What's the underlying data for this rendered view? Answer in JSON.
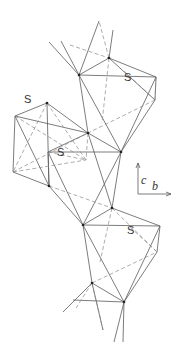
{
  "figure": {
    "type": "crystal-structure-polyhedra",
    "labels": [
      {
        "text": "S",
        "x": 127,
        "y": 78
      },
      {
        "text": "S",
        "x": 27,
        "y": 100
      },
      {
        "text": "S",
        "x": 60,
        "y": 153
      },
      {
        "text": "S",
        "x": 130,
        "y": 231
      }
    ],
    "axes": {
      "c_label": "c",
      "b_label": "b",
      "origin": [
        138,
        194
      ],
      "c_tip": [
        138,
        163
      ],
      "b_tip": [
        171,
        194
      ]
    },
    "colors": {
      "solid": "#5a5a5a",
      "dashed": "#8a8a8a",
      "node": "#222222"
    },
    "nodes": [
      [
        79,
        75
      ],
      [
        109,
        58
      ],
      [
        88,
        133
      ],
      [
        121,
        152
      ],
      [
        47,
        103
      ],
      [
        49,
        186
      ],
      [
        112,
        208
      ],
      [
        83,
        225
      ],
      [
        92,
        283
      ],
      [
        124,
        302
      ]
    ],
    "solid_lines": [
      [
        [
          49,
          42
        ],
        [
          79,
          75
        ]
      ],
      [
        [
          61,
          41
        ],
        [
          79,
          75
        ]
      ],
      [
        [
          79,
          75
        ],
        [
          99,
          21
        ]
      ],
      [
        [
          109,
          58
        ],
        [
          113,
          30
        ]
      ],
      [
        [
          79,
          75
        ],
        [
          109,
          58
        ]
      ],
      [
        [
          79,
          75
        ],
        [
          156,
          77
        ]
      ],
      [
        [
          109,
          58
        ],
        [
          156,
          77
        ]
      ],
      [
        [
          156,
          77
        ],
        [
          155,
          100
        ]
      ],
      [
        [
          155,
          100
        ],
        [
          121,
          152
        ]
      ],
      [
        [
          156,
          77
        ],
        [
          121,
          152
        ]
      ],
      [
        [
          79,
          75
        ],
        [
          88,
          133
        ]
      ],
      [
        [
          79,
          75
        ],
        [
          121,
          152
        ]
      ],
      [
        [
          109,
          58
        ],
        [
          155,
          100
        ]
      ],
      [
        [
          47,
          103
        ],
        [
          15,
          116
        ]
      ],
      [
        [
          47,
          103
        ],
        [
          88,
          133
        ]
      ],
      [
        [
          15,
          116
        ],
        [
          88,
          133
        ]
      ],
      [
        [
          15,
          116
        ],
        [
          13,
          172
        ]
      ],
      [
        [
          15,
          116
        ],
        [
          49,
          186
        ]
      ],
      [
        [
          47,
          103
        ],
        [
          49,
          186
        ]
      ],
      [
        [
          13,
          172
        ],
        [
          49,
          186
        ]
      ],
      [
        [
          88,
          133
        ],
        [
          121,
          152
        ]
      ],
      [
        [
          48,
          152
        ],
        [
          121,
          152
        ]
      ],
      [
        [
          48,
          152
        ],
        [
          88,
          133
        ]
      ],
      [
        [
          48,
          152
        ],
        [
          49,
          186
        ]
      ],
      [
        [
          48,
          152
        ],
        [
          83,
          225
        ]
      ],
      [
        [
          49,
          186
        ],
        [
          83,
          225
        ]
      ],
      [
        [
          121,
          152
        ],
        [
          112,
          208
        ]
      ],
      [
        [
          121,
          152
        ],
        [
          83,
          225
        ]
      ],
      [
        [
          88,
          133
        ],
        [
          112,
          208
        ]
      ],
      [
        [
          83,
          225
        ],
        [
          112,
          208
        ]
      ],
      [
        [
          112,
          208
        ],
        [
          160,
          226
        ]
      ],
      [
        [
          83,
          225
        ],
        [
          160,
          226
        ]
      ],
      [
        [
          160,
          226
        ],
        [
          157,
          252
        ]
      ],
      [
        [
          157,
          252
        ],
        [
          124,
          302
        ]
      ],
      [
        [
          160,
          226
        ],
        [
          124,
          302
        ]
      ],
      [
        [
          83,
          225
        ],
        [
          92,
          283
        ]
      ],
      [
        [
          83,
          225
        ],
        [
          124,
          302
        ]
      ],
      [
        [
          92,
          283
        ],
        [
          124,
          302
        ]
      ],
      [
        [
          73,
          300
        ],
        [
          124,
          302
        ]
      ],
      [
        [
          63,
          312
        ],
        [
          92,
          283
        ]
      ],
      [
        [
          92,
          283
        ],
        [
          103,
          330
        ]
      ],
      [
        [
          124,
          302
        ],
        [
          114,
          342
        ]
      ],
      [
        [
          124,
          302
        ],
        [
          123,
          342
        ]
      ]
    ],
    "dashed_lines": [
      [
        [
          70,
          45
        ],
        [
          109,
          58
        ]
      ],
      [
        [
          109,
          58
        ],
        [
          99,
          21
        ]
      ],
      [
        [
          109,
          58
        ],
        [
          102,
          123
        ]
      ],
      [
        [
          156,
          77
        ],
        [
          155,
          100
        ]
      ],
      [
        [
          124,
          71
        ],
        [
          155,
          100
        ]
      ],
      [
        [
          155,
          100
        ],
        [
          88,
          133
        ]
      ],
      [
        [
          47,
          103
        ],
        [
          86,
          160
        ]
      ],
      [
        [
          15,
          116
        ],
        [
          86,
          160
        ]
      ],
      [
        [
          13,
          172
        ],
        [
          86,
          160
        ]
      ],
      [
        [
          88,
          133
        ],
        [
          86,
          160
        ]
      ],
      [
        [
          48,
          152
        ],
        [
          86,
          160
        ]
      ],
      [
        [
          13,
          172
        ],
        [
          88,
          133
        ]
      ],
      [
        [
          49,
          186
        ],
        [
          112,
          208
        ]
      ],
      [
        [
          47,
          103
        ],
        [
          13,
          172
        ]
      ],
      [
        [
          112,
          208
        ],
        [
          100,
          262
        ]
      ],
      [
        [
          130,
          227
        ],
        [
          157,
          252
        ]
      ],
      [
        [
          112,
          208
        ],
        [
          157,
          252
        ]
      ],
      [
        [
          92,
          283
        ],
        [
          157,
          252
        ]
      ],
      [
        [
          92,
          283
        ],
        [
          76,
          308
        ]
      ],
      [
        [
          92,
          283
        ],
        [
          103,
          330
        ]
      ]
    ]
  }
}
